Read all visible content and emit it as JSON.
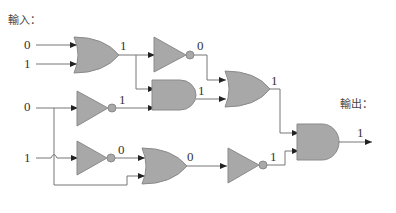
{
  "labels": {
    "input_title": "輸入：",
    "output_title": "輸出："
  },
  "inputs": [
    "0",
    "1",
    "0",
    "1"
  ],
  "gate_outputs": {
    "or1": "1",
    "not1": "0",
    "not2": "1",
    "and1": "1",
    "or2": "1",
    "not3": "0",
    "or3": "0",
    "not4": "1",
    "and_final": "1"
  },
  "colors": {
    "gate_fill": "#a8a8a8",
    "wire": "#777777"
  }
}
